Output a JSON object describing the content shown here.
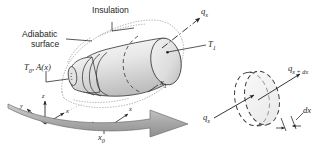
{
  "figure": {
    "name": "conduction-in-tapered-insulated-rod",
    "background": "#ffffff",
    "ink": "#231f20",
    "body_fill_light": "#f2f2f2",
    "body_fill_dark": "#c9c9c9",
    "arrow_fill": "#b3b3b3"
  },
  "labels": {
    "insulation": "Insulation",
    "adiabatic_line1": "Adiabatic",
    "adiabatic_line2": "surface",
    "t0_area": "T",
    "t0_sub": "0",
    "t0_rest": ", A(x)",
    "t1": "T",
    "t1_sub": "1",
    "qx_top": "q",
    "qx_top_sub": "x",
    "qx_mid": "q",
    "qx_mid_sub": "x",
    "qx_dx": "q",
    "qx_dx_sub": "x + dx",
    "dx": "dx",
    "x1": "x",
    "x1_sub": "1",
    "x0": "x",
    "x0_sub": "0",
    "axis_x": "x",
    "axis_y": "y",
    "axis_z": "z",
    "axis_x_inset": "x"
  }
}
